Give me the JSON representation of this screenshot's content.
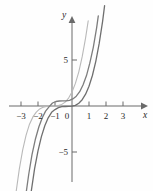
{
  "figure": {
    "title": "",
    "background_color": "#fefefe"
  },
  "chart_data": {
    "type": "line",
    "title": "",
    "xlabel": "x",
    "ylabel": "y",
    "xlim": [
      -3.6,
      3.6
    ],
    "ylim": [
      -8.5,
      9.2
    ],
    "grid": false,
    "legend": "none",
    "axis_color": "#6a6a6a",
    "x_ticks": [
      -3,
      -2,
      -1,
      1,
      2,
      3
    ],
    "x_tick_labels": [
      "−3",
      "−2",
      "−1",
      "1",
      "2",
      "3"
    ],
    "y_ticks": [
      5,
      -5
    ],
    "y_tick_labels": [
      "5",
      "−5"
    ],
    "origin_label": "0",
    "series": [
      {
        "name": "curve-left",
        "color": "#b9b9b9",
        "width": 1.1,
        "expression": "y = (x + 1.15)^3",
        "points": [
          [
            -3.3,
            -9.5
          ],
          [
            -3.1,
            -6.86
          ],
          [
            -2.9,
            -4.76
          ],
          [
            -2.7,
            -3.16
          ],
          [
            -2.5,
            -1.98
          ],
          [
            -2.3,
            -1.18
          ],
          [
            -2.1,
            -0.66
          ],
          [
            -1.9,
            -0.32
          ],
          [
            -1.7,
            -0.14
          ],
          [
            -1.5,
            -0.04
          ],
          [
            -1.3,
            -0.004
          ],
          [
            -1.15,
            0.0
          ],
          [
            -1.0,
            0.004
          ],
          [
            -0.8,
            0.04
          ],
          [
            -0.6,
            0.17
          ],
          [
            -0.4,
            0.42
          ],
          [
            -0.2,
            0.86
          ],
          [
            0.0,
            1.52
          ],
          [
            0.2,
            2.46
          ],
          [
            0.4,
            3.72
          ],
          [
            0.6,
            5.36
          ],
          [
            0.8,
            7.41
          ],
          [
            0.95,
            9.26
          ]
        ]
      },
      {
        "name": "curve-middle",
        "color": "#7d7d7d",
        "width": 1.3,
        "expression": "y = (x + 0.55)^3 + 0.55",
        "points": [
          [
            -2.95,
            -13.0
          ],
          [
            -2.75,
            -10.1
          ],
          [
            -2.55,
            -7.45
          ],
          [
            -2.35,
            -5.28
          ],
          [
            -2.15,
            -3.55
          ],
          [
            -1.95,
            -2.25
          ],
          [
            -1.75,
            -1.28
          ],
          [
            -1.55,
            -0.55
          ],
          [
            -1.35,
            -0.1
          ],
          [
            -1.15,
            0.33
          ],
          [
            -0.95,
            0.49
          ],
          [
            -0.75,
            0.54
          ],
          [
            -0.55,
            0.55
          ],
          [
            -0.35,
            0.56
          ],
          [
            -0.15,
            0.61
          ],
          [
            0.05,
            0.77
          ],
          [
            0.25,
            1.06
          ],
          [
            0.45,
            1.55
          ],
          [
            0.65,
            2.28
          ],
          [
            0.85,
            3.3
          ],
          [
            1.05,
            4.65
          ],
          [
            1.25,
            6.38
          ],
          [
            1.45,
            8.55
          ],
          [
            1.55,
            9.8
          ]
        ]
      },
      {
        "name": "curve-right",
        "color": "#6f6f6f",
        "width": 1.3,
        "expression": "y = (x + 0.30)^3 - 0.05",
        "points": [
          [
            -2.8,
            -15.6
          ],
          [
            -2.6,
            -12.2
          ],
          [
            -2.4,
            -9.3
          ],
          [
            -2.2,
            -6.8
          ],
          [
            -2.0,
            -4.87
          ],
          [
            -1.8,
            -3.33
          ],
          [
            -1.6,
            -2.15
          ],
          [
            -1.4,
            -1.28
          ],
          [
            -1.2,
            -0.68
          ],
          [
            -1.0,
            -0.39
          ],
          [
            -0.8,
            -0.17
          ],
          [
            -0.6,
            -0.08
          ],
          [
            -0.4,
            -0.05
          ],
          [
            -0.2,
            -0.04
          ],
          [
            0.0,
            -0.02
          ],
          [
            0.2,
            0.07
          ],
          [
            0.4,
            0.29
          ],
          [
            0.6,
            0.68
          ],
          [
            0.8,
            1.28
          ],
          [
            1.0,
            2.15
          ],
          [
            1.2,
            3.32
          ],
          [
            1.4,
            4.86
          ],
          [
            1.6,
            6.8
          ],
          [
            1.8,
            9.21
          ],
          [
            1.92,
            10.9
          ]
        ]
      }
    ]
  }
}
